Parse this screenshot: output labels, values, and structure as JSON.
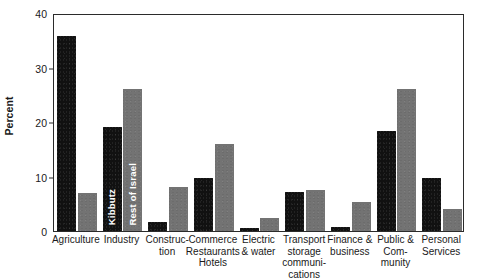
{
  "chart_data": {
    "type": "bar",
    "title": "",
    "xlabel": "",
    "ylabel": "Percent",
    "ylim": [
      0,
      40
    ],
    "yticks": [
      0,
      10,
      20,
      30,
      40
    ],
    "grid": false,
    "legend_position": "inside-bars",
    "categories": [
      "Agriculture",
      "Industry",
      "Construc-\ntion",
      "Commerce\nRestaurants\nHotels",
      "Electric\n& water",
      "Transport\nstorage\ncommuni-\ncations",
      "Finance &\nbusiness",
      "Public &\nCom-\nmunity",
      "Personal\nServices"
    ],
    "series": [
      {
        "name": "Kibbutz",
        "color": "#111111",
        "values": [
          35.7,
          19.0,
          1.7,
          9.8,
          0.6,
          7.2,
          0.7,
          18.3,
          9.8
        ]
      },
      {
        "name": "Rest of Israel",
        "color": "#737373",
        "values": [
          7.0,
          26.0,
          8.0,
          16.0,
          2.4,
          7.6,
          5.3,
          26.0,
          4.0
        ]
      }
    ],
    "legend_inline": [
      {
        "label": "Kibbutz",
        "series": 0,
        "category_index": 1
      },
      {
        "label": "Rest of Israel",
        "series": 1,
        "category_index": 1
      }
    ]
  }
}
